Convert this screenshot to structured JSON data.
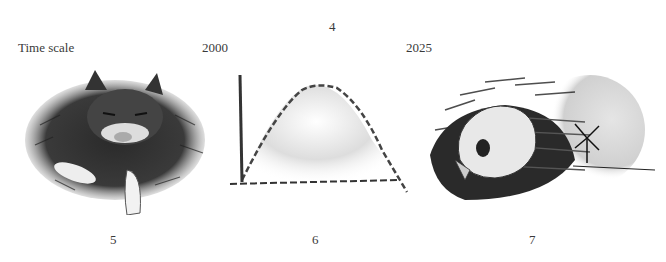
{
  "header": {
    "figure_number": "4",
    "time_scale_label": "Time scale",
    "year_start": "2000",
    "year_end": "2025"
  },
  "panels": [
    {
      "illustration": "sleeping-cat",
      "number": "5"
    },
    {
      "illustration": "rise-and-fall-curve",
      "number": "6"
    },
    {
      "illustration": "skull-and-windmill",
      "number": "7"
    }
  ]
}
